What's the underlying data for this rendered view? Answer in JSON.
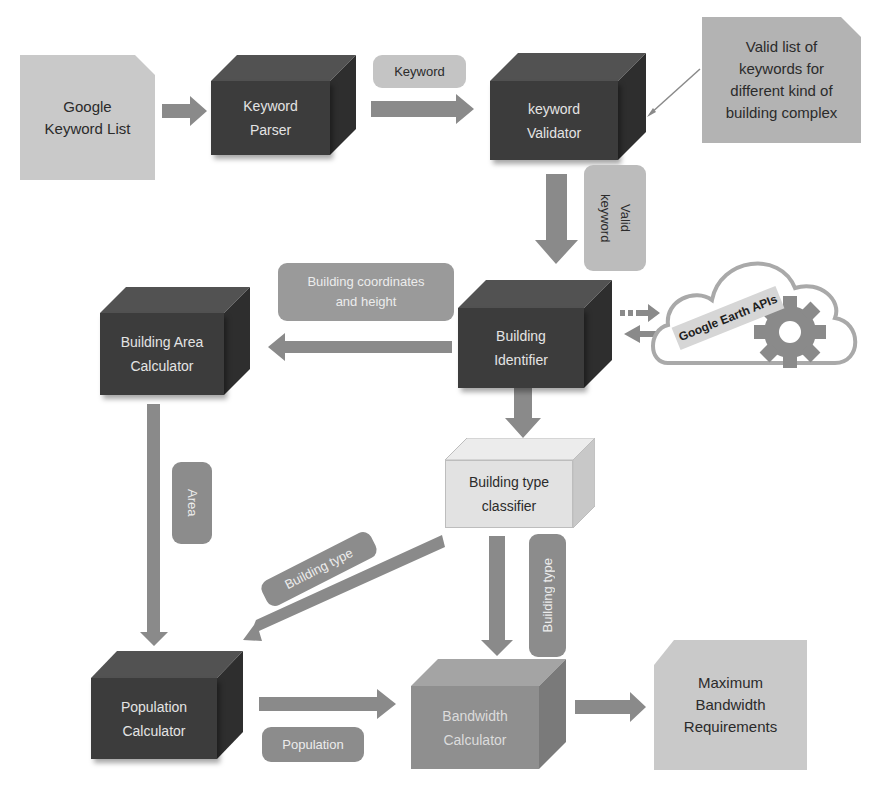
{
  "diagram": {
    "nodes": {
      "google_keyword_list": {
        "label_line1": "Google",
        "label_line2": "Keyword List",
        "shape": "document"
      },
      "keyword_parser": {
        "label_line1": "Keyword",
        "label_line2": "Parser",
        "shape": "cube-dark"
      },
      "keyword_validator": {
        "label_line1": "keyword",
        "label_line2": "Validator",
        "shape": "cube-dark"
      },
      "valid_keywords_doc": {
        "label_line1": "Valid list of",
        "label_line2": "keywords for",
        "label_line3": "different kind of",
        "label_line4": "building complex",
        "shape": "document"
      },
      "building_identifier": {
        "label_line1": "Building",
        "label_line2": "Identifier",
        "shape": "cube-dark"
      },
      "google_earth_apis": {
        "label": "Google Earth APIs",
        "shape": "cloud",
        "icon": "gear-icon"
      },
      "building_area_calculator": {
        "label_line1": "Building Area",
        "label_line2": "Calculator",
        "shape": "cube-dark"
      },
      "building_type_classifier": {
        "label_line1": "Building type",
        "label_line2": "classifier",
        "shape": "cube-light"
      },
      "population_calculator": {
        "label_line1": "Population",
        "label_line2": "Calculator",
        "shape": "cube-dark"
      },
      "bandwidth_calculator": {
        "label_line1": "Bandwidth",
        "label_line2": "Calculator",
        "shape": "cube-mid"
      },
      "max_bandwidth_doc": {
        "label_line1": "Maximum",
        "label_line2": "Bandwidth",
        "label_line3": "Requirements",
        "shape": "document"
      }
    },
    "edge_labels": {
      "keyword": "Keyword",
      "valid_keyword_line1": "Valid",
      "valid_keyword_line2": "keyword",
      "coords_line1": "Building coordinates",
      "coords_line2": "and height",
      "area": "Area",
      "building_type_diag": "Building type",
      "building_type_vert": "Building type",
      "population": "Population"
    },
    "colors": {
      "dark_cube": "#3c3c3c",
      "light_cube": "#e2e2e2",
      "mid_cube": "#8f8f8f",
      "arrow": "#8a8a8a",
      "document": "#c9c9c9"
    }
  }
}
